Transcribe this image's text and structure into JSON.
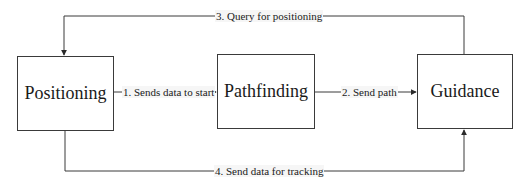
{
  "diagram": {
    "type": "flowchart",
    "nodes": [
      {
        "id": "positioning",
        "label": "Positioning"
      },
      {
        "id": "pathfinding",
        "label": "Pathfinding"
      },
      {
        "id": "guidance",
        "label": "Guidance"
      }
    ],
    "edges": [
      {
        "id": "e1",
        "from": "positioning",
        "to": "pathfinding",
        "label": "1. Sends data to start"
      },
      {
        "id": "e2",
        "from": "pathfinding",
        "to": "guidance",
        "label": "2. Send path"
      },
      {
        "id": "e3",
        "from": "guidance",
        "to": "positioning",
        "label": "3. Query for positioning"
      },
      {
        "id": "e4",
        "from": "positioning",
        "to": "guidance",
        "label": "4. Send data for tracking"
      }
    ]
  },
  "colors": {
    "line": "#3a3a3a",
    "text": "#1a1a1a",
    "label_background": "#f6f6f6",
    "background": "#ffffff"
  }
}
